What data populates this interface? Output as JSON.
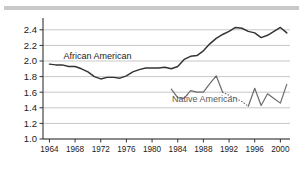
{
  "chart_data": {
    "type": "line",
    "title": "",
    "subtitle": "",
    "xlabel": "",
    "ylabel": "",
    "xlim": [
      1963,
      2001.5
    ],
    "ylim": [
      1.0,
      2.5
    ],
    "grid": true,
    "grid_axis": "y",
    "legend_position": "inline-annotation",
    "yticks": [
      "1.0",
      "1.2",
      "1.4",
      "1.6",
      "1.8",
      "2.0",
      "2.2",
      "2.4"
    ],
    "ytick_values": [
      1.0,
      1.2,
      1.4,
      1.6,
      1.8,
      2.0,
      2.2,
      2.4
    ],
    "xticks": [
      "1964",
      "1968",
      "1972",
      "1976",
      "1980",
      "1984",
      "1988",
      "1992",
      "1996",
      "2000"
    ],
    "xtick_values": [
      1964,
      1968,
      1972,
      1976,
      1980,
      1984,
      1988,
      1992,
      1996,
      2000
    ],
    "series": [
      {
        "name": "African American",
        "label": "African American",
        "color": "#333333",
        "style": "solid",
        "label_x": 1971.5,
        "label_y": 2.03,
        "x": [
          1964,
          1965,
          1966,
          1967,
          1968,
          1969,
          1970,
          1971,
          1972,
          1973,
          1974,
          1975,
          1976,
          1977,
          1978,
          1979,
          1980,
          1981,
          1982,
          1983,
          1984,
          1985,
          1986,
          1987,
          1988,
          1989,
          1990,
          1991,
          1992,
          1993,
          1994,
          1995,
          1996,
          1997,
          1998,
          1999,
          2000,
          2001
        ],
        "y": [
          1.96,
          1.95,
          1.95,
          1.93,
          1.93,
          1.9,
          1.86,
          1.8,
          1.77,
          1.79,
          1.79,
          1.78,
          1.81,
          1.86,
          1.89,
          1.91,
          1.91,
          1.91,
          1.92,
          1.9,
          1.93,
          2.02,
          2.06,
          2.07,
          2.13,
          2.22,
          2.29,
          2.34,
          2.38,
          2.43,
          2.42,
          2.38,
          2.36,
          2.3,
          2.33,
          2.38,
          2.43,
          2.36
        ]
      },
      {
        "name": "Native American",
        "label": "Native American",
        "color": "#6b6b6b",
        "style": "solid-with-dotted-gap",
        "label_x": 1988.2,
        "label_y": 1.47,
        "segments": [
          {
            "style": "solid",
            "x": [
              1983,
              1984,
              1985,
              1986,
              1987,
              1988,
              1989,
              1990,
              1991
            ],
            "y": [
              1.64,
              1.53,
              1.52,
              1.62,
              1.6,
              1.6,
              1.71,
              1.81,
              1.6
            ]
          },
          {
            "style": "dotted",
            "x": [
              1991,
              1992,
              1993,
              1994,
              1995
            ],
            "y": [
              1.6,
              1.56,
              1.52,
              1.48,
              1.42
            ]
          },
          {
            "style": "solid",
            "x": [
              1995,
              1996,
              1997,
              1998,
              1999,
              2000,
              2001
            ],
            "y": [
              1.42,
              1.65,
              1.43,
              1.58,
              1.52,
              1.46,
              1.7
            ]
          }
        ]
      }
    ]
  }
}
